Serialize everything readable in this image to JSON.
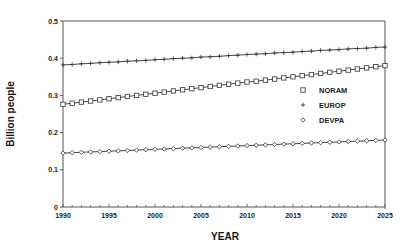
{
  "chart_data": {
    "type": "line",
    "title": "",
    "xlabel": "YEAR",
    "ylabel": "Billion people",
    "xlim": [
      1990,
      2025
    ],
    "ylim": [
      0,
      0.5
    ],
    "x_ticks": [
      "1990",
      "1995",
      "2000",
      "2005",
      "2010",
      "2015",
      "2020",
      "2025"
    ],
    "y_ticks": [
      "0",
      "0.1",
      "0.2",
      "0.3",
      "0.4",
      "0.5"
    ],
    "grid": false,
    "legend_position": "right-middle inside plot",
    "x": [
      1990,
      1991,
      1992,
      1993,
      1994,
      1995,
      1996,
      1997,
      1998,
      1999,
      2000,
      2001,
      2002,
      2003,
      2004,
      2005,
      2006,
      2007,
      2008,
      2009,
      2010,
      2011,
      2012,
      2013,
      2014,
      2015,
      2016,
      2017,
      2018,
      2019,
      2020,
      2021,
      2022,
      2023,
      2024,
      2025
    ],
    "series": [
      {
        "name": "NORAM",
        "marker": "square",
        "start": 0.276,
        "end": 0.38,
        "values": [
          0.276,
          0.279,
          0.282,
          0.285,
          0.288,
          0.291,
          0.294,
          0.297,
          0.3,
          0.303,
          0.306,
          0.309,
          0.312,
          0.315,
          0.318,
          0.321,
          0.324,
          0.327,
          0.33,
          0.333,
          0.336,
          0.338,
          0.341,
          0.344,
          0.347,
          0.35,
          0.353,
          0.356,
          0.359,
          0.362,
          0.365,
          0.368,
          0.371,
          0.374,
          0.377,
          0.38
        ]
      },
      {
        "name": "EUROP",
        "marker": "plus",
        "start": 0.382,
        "end": 0.43,
        "values": [
          0.382,
          0.383,
          0.385,
          0.386,
          0.388,
          0.389,
          0.39,
          0.392,
          0.393,
          0.394,
          0.396,
          0.397,
          0.399,
          0.4,
          0.401,
          0.403,
          0.404,
          0.405,
          0.407,
          0.408,
          0.41,
          0.411,
          0.412,
          0.414,
          0.415,
          0.416,
          0.418,
          0.419,
          0.421,
          0.422,
          0.423,
          0.425,
          0.426,
          0.427,
          0.429,
          0.43
        ]
      },
      {
        "name": "DEVPA",
        "marker": "diamond",
        "start": 0.145,
        "end": 0.18,
        "values": [
          0.145,
          0.146,
          0.147,
          0.148,
          0.149,
          0.15,
          0.151,
          0.152,
          0.153,
          0.154,
          0.155,
          0.156,
          0.157,
          0.158,
          0.159,
          0.16,
          0.161,
          0.162,
          0.163,
          0.164,
          0.165,
          0.166,
          0.167,
          0.168,
          0.169,
          0.17,
          0.171,
          0.172,
          0.173,
          0.174,
          0.175,
          0.176,
          0.177,
          0.178,
          0.179,
          0.18
        ]
      }
    ]
  },
  "legend": {
    "items": [
      {
        "label": "NORAM",
        "marker": "square"
      },
      {
        "label": "EUROP",
        "marker": "plus"
      },
      {
        "label": "DEVPA",
        "marker": "diamond"
      }
    ]
  },
  "colors": {
    "line": "#333333",
    "frame": "#555555",
    "text": "#222222"
  }
}
